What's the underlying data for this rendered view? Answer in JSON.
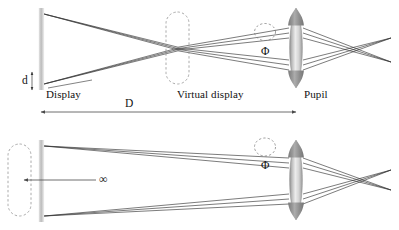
{
  "figure": {
    "title": "",
    "background_color": "#ffffff",
    "ink_color": "#2b2b2b"
  },
  "labels": {
    "display": "Display",
    "virtual_display": "Virtual display",
    "pupil": "Pupil",
    "d": "d",
    "D": "D",
    "phi_top": "Φ",
    "phi_bottom": "Φ",
    "infinity": "∞"
  },
  "panels": [
    {
      "name": "finite-distance-panel",
      "display_x": 41,
      "virtual_display_x": 178,
      "pupil_x": 296,
      "retina_x": 390,
      "axis_y": 48,
      "display_half_height": 38,
      "virtual_display_half_height": 34,
      "pupil_half_height": 40,
      "ray_fan_count": 3,
      "crossing": true,
      "annotations": [
        "Display",
        "Virtual display",
        "Pupil",
        "d",
        "D",
        "Φ"
      ]
    },
    {
      "name": "infinity-panel",
      "virtual_display_x": 19,
      "display_x": 41,
      "pupil_x": 296,
      "retina_x": 390,
      "axis_y": 180,
      "display_half_height": 38,
      "virtual_display_half_height": 34,
      "pupil_half_height": 40,
      "ray_fan_count": 3,
      "collimated": true,
      "annotations": [
        "∞",
        "Φ"
      ]
    }
  ],
  "dimensions": {
    "d_label": "d",
    "d_description": "display extent",
    "D_label": "D",
    "D_description": "display to pupil distance",
    "phi_label": "Φ",
    "phi_description": "pupil aperture"
  },
  "colors": {
    "ray": "#3a3a3a",
    "display_bar_light": "#e6e6e6",
    "display_bar_dark": "#b4b4b4",
    "lens_light": "#f2f2f2",
    "lens_mid": "#cfcfcf",
    "lens_dark": "#8e8e8e",
    "dash": "#8a8a8a",
    "arrow": "#555555"
  }
}
